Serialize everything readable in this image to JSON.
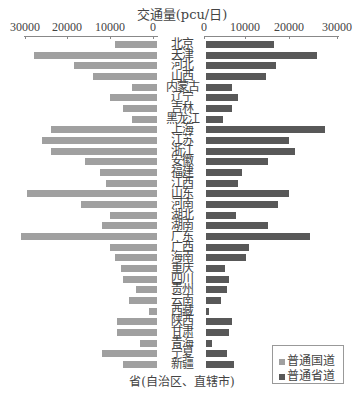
{
  "chart_data": {
    "type": "bar",
    "orientation": "horizontal-butterfly",
    "title": "交通量(pcu/日)",
    "xlabel": "省(自治区、直辖市)",
    "ylabel": "",
    "left_axis_ticks": [
      "30000",
      "20000",
      "10000",
      "0"
    ],
    "right_axis_ticks": [
      "0",
      "10000",
      "20000",
      "30000"
    ],
    "xlim": [
      0,
      32000
    ],
    "legend_position": "bottom-right",
    "categories": [
      "北京",
      "天津",
      "河北",
      "山西",
      "内蒙古",
      "辽宁",
      "吉林",
      "黑龙江",
      "上海",
      "江苏",
      "浙江",
      "安徽",
      "福建",
      "江西",
      "山东",
      "河南",
      "湖北",
      "湖南",
      "广东",
      "广西",
      "海南",
      "重庆",
      "四川",
      "贵州",
      "云南",
      "西藏",
      "陕西",
      "甘肃",
      "青海",
      "宁夏",
      "新疆"
    ],
    "series": [
      {
        "name": "普通国道",
        "side": "left",
        "color": "#a0a0a0",
        "values": [
          10000,
          29000,
          19500,
          15000,
          6000,
          11000,
          8000,
          6000,
          25000,
          27000,
          25000,
          17000,
          13500,
          12000,
          30500,
          18000,
          11000,
          13000,
          32000,
          11000,
          10000,
          8500,
          8000,
          5000,
          6500,
          2000,
          9500,
          9500,
          4000,
          13000,
          8000
        ]
      },
      {
        "name": "普通省道",
        "side": "right",
        "color": "#585858",
        "values": [
          16000,
          26000,
          16500,
          14000,
          6000,
          7500,
          6000,
          4000,
          28000,
          19500,
          21000,
          14500,
          8500,
          7500,
          19500,
          17000,
          7000,
          14500,
          24500,
          10000,
          9500,
          4500,
          5500,
          5000,
          3500,
          800,
          6000,
          5500,
          1500,
          5000,
          6500
        ]
      }
    ]
  },
  "legend": {
    "items": [
      {
        "label": "普通国道"
      },
      {
        "label": "普通省道"
      }
    ]
  }
}
